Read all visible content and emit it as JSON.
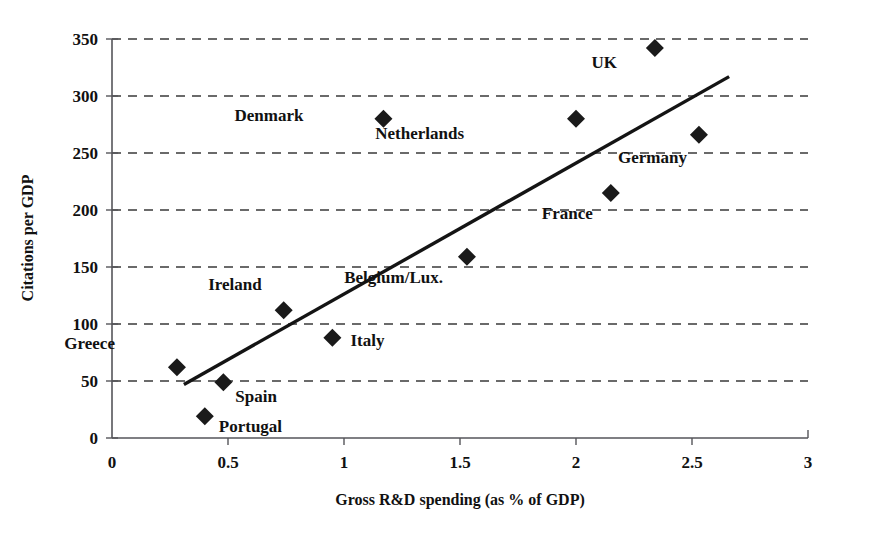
{
  "chart_data": {
    "type": "scatter",
    "title": "",
    "xlabel": "Gross R&D spending (as % of GDP)",
    "ylabel": "Citations per GDP",
    "xlim": [
      0,
      3
    ],
    "ylim": [
      0,
      350
    ],
    "xticks": [
      "0",
      "0.5",
      "1",
      "1.5",
      "2",
      "2.5",
      "3"
    ],
    "xtick_values": [
      0,
      0.5,
      1,
      1.5,
      2,
      2.5,
      3
    ],
    "yticks": [
      "0",
      "50",
      "100",
      "150",
      "200",
      "250",
      "300",
      "350"
    ],
    "ytick_values": [
      0,
      50,
      100,
      150,
      200,
      250,
      300,
      350
    ],
    "grid": "horizontal-dashed",
    "legend": "none",
    "marker": "filled-diamond",
    "marker_color": "#1a1a1a",
    "points": [
      {
        "label": "Greece",
        "x": 0.28,
        "y": 62,
        "label_dx": -62,
        "label_dy": -18
      },
      {
        "label": "Portugal",
        "x": 0.4,
        "y": 19,
        "label_dx": 14,
        "label_dy": 16
      },
      {
        "label": "Spain",
        "x": 0.48,
        "y": 49,
        "label_dx": 12,
        "label_dy": 20
      },
      {
        "label": "Ireland",
        "x": 0.74,
        "y": 112,
        "label_dx": -22,
        "label_dy": -20
      },
      {
        "label": "Italy",
        "x": 0.95,
        "y": 88,
        "label_dx": 18,
        "label_dy": 8
      },
      {
        "label": "Denmark",
        "x": 1.17,
        "y": 280,
        "label_dx": -80,
        "label_dy": 2
      },
      {
        "label": "Belgium/Lux.",
        "x": 1.53,
        "y": 159,
        "label_dx": -24,
        "label_dy": 26
      },
      {
        "label": "Netherlands",
        "x": 2.0,
        "y": 280,
        "label_dx": -112,
        "label_dy": 20
      },
      {
        "label": "France",
        "x": 2.15,
        "y": 215,
        "label_dx": -18,
        "label_dy": 26
      },
      {
        "label": "UK",
        "x": 2.34,
        "y": 342,
        "label_dx": -38,
        "label_dy": 20
      },
      {
        "label": "Germany",
        "x": 2.53,
        "y": 266,
        "label_dx": -12,
        "label_dy": 28
      }
    ],
    "trendline": {
      "type": "linear-fit",
      "x_start": 0.31,
      "y_start": 47,
      "x_end": 2.66,
      "y_end": 317
    }
  },
  "axis": {
    "x_title": "Gross R&D spending (as % of GDP)",
    "y_title": "Citations per GDP"
  }
}
